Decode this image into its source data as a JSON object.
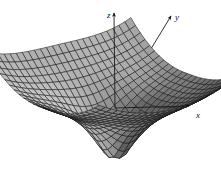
{
  "figure": {
    "kind": "surface-plot-3d",
    "background_color": "#ffffff",
    "width": 221,
    "height": 179,
    "title": "",
    "caption": ""
  },
  "axes": {
    "z": {
      "label": "z",
      "icon": "arrow-up-icon",
      "origin": [
        115,
        108
      ],
      "tip": [
        114,
        13
      ],
      "color": "#1a1a1a",
      "label_pos": [
        107,
        11
      ]
    },
    "y": {
      "label": "y",
      "icon": "arrow-upright-icon",
      "origin": [
        115,
        108
      ],
      "tip": [
        171,
        16
      ],
      "color": "#1a1a1a",
      "label_pos": [
        175,
        13
      ]
    },
    "x": {
      "label": "x",
      "icon": "arrow-right-icon",
      "origin": [
        115,
        108
      ],
      "tip": [
        189,
        106
      ],
      "color": "#1a1a1a",
      "label_pos": [
        196,
        111
      ]
    }
  },
  "chart_data": {
    "type": "surface",
    "title": "",
    "xlabel": "x",
    "ylabel": "y",
    "zlabel": "z",
    "grid": true,
    "legend": false,
    "mesh": {
      "u_divisions": 24,
      "v_divisions": 24,
      "u_range": [
        -1.0,
        1.0
      ],
      "v_range": [
        -1.0,
        1.0
      ],
      "line_color": "#161616",
      "line_width": 0.55
    },
    "surface_shading": {
      "min_gray": "#3a3a3a",
      "max_gray": "#d8d8d8",
      "light_direction": [
        0.55,
        -0.35,
        0.76
      ]
    },
    "singularity": {
      "center": [
        0,
        0
      ],
      "depth": -1.55,
      "radius": 0.1
    },
    "projection": {
      "azimuth_deg": 38,
      "elevation_deg": 22,
      "scale_x": 92,
      "scale_y": 74,
      "z_scale": 40,
      "origin_px": [
        115,
        108
      ]
    },
    "z_extremes": {
      "min": -1.55,
      "max": 0.95
    }
  }
}
